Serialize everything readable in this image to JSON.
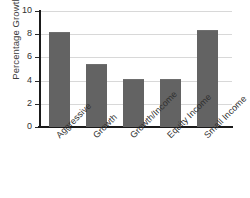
{
  "chart_data": {
    "type": "bar",
    "title": "",
    "xlabel": "",
    "ylabel": "Percentage Growth",
    "categories": [
      "Aggressive",
      "Growth",
      "Growth/Income",
      "Equity Income",
      "Small Income"
    ],
    "values": [
      8.2,
      5.4,
      4.15,
      4.1,
      8.4
    ],
    "ylim": [
      0,
      10
    ],
    "ytick_labels": [
      "0",
      "2",
      "4",
      "6",
      "8",
      "10"
    ],
    "ytick_values": [
      0,
      2,
      4,
      6,
      8,
      10
    ],
    "grid": true,
    "legend": "none",
    "bar_color": "#636363",
    "gridline_color": "#d8d8d8",
    "axis_color": "#1a1a1a",
    "text_color": "#2f2f2f"
  }
}
